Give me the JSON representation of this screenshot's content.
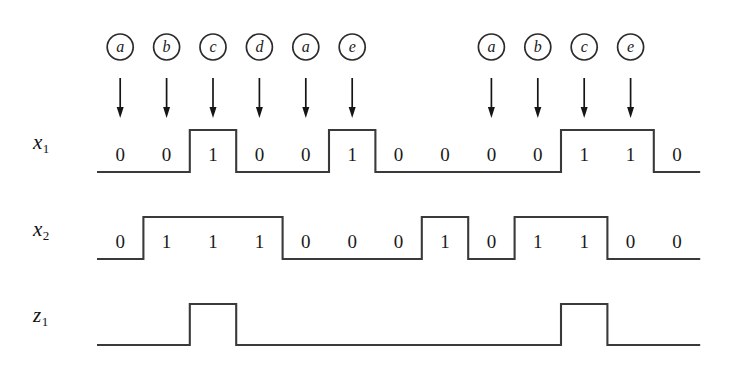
{
  "figure": {
    "type": "digital-timing-diagram",
    "background_color": "#ffffff",
    "line_color": "#3a3a3a",
    "text_color": "#1a1a1a",
    "num_cells": 13,
    "grid": {
      "x_start": 97,
      "cell_width": 46.4,
      "x_end": 700
    }
  },
  "input_symbols": [
    {
      "label": "a",
      "cell": 1
    },
    {
      "label": "b",
      "cell": 2
    },
    {
      "label": "c",
      "cell": 3
    },
    {
      "label": "d",
      "cell": 4
    },
    {
      "label": "a",
      "cell": 5
    },
    {
      "label": "e",
      "cell": 6
    },
    {
      "label": "a",
      "cell": 9
    },
    {
      "label": "b",
      "cell": 10
    },
    {
      "label": "c",
      "cell": 11
    },
    {
      "label": "e",
      "cell": 12
    }
  ],
  "rows": [
    {
      "name": "x1",
      "label_base": "x",
      "label_sub": "1",
      "show_bits": true,
      "bits": [
        0,
        0,
        1,
        0,
        0,
        1,
        0,
        0,
        0,
        0,
        1,
        1,
        0
      ]
    },
    {
      "name": "x2",
      "label_base": "x",
      "label_sub": "2",
      "show_bits": true,
      "bits": [
        0,
        1,
        1,
        1,
        0,
        0,
        0,
        1,
        0,
        1,
        1,
        0,
        0
      ]
    },
    {
      "name": "z1",
      "label_base": "z",
      "label_sub": "1",
      "show_bits": false,
      "bits": [
        0,
        0,
        1,
        0,
        0,
        0,
        0,
        0,
        0,
        0,
        1,
        0,
        0
      ]
    }
  ],
  "geometry": {
    "circle_center_y": 47,
    "circle_radius": 13,
    "arrow_top_y": 78,
    "arrow_bottom_y": 118,
    "rows_y": [
      {
        "name": "x1",
        "low": 172,
        "high": 130,
        "label_y": 143
      },
      {
        "name": "x2",
        "low": 259,
        "high": 217,
        "label_y": 230
      },
      {
        "name": "z1",
        "low": 345,
        "high": 304,
        "label_y": 316
      }
    ],
    "label_x": 33
  }
}
